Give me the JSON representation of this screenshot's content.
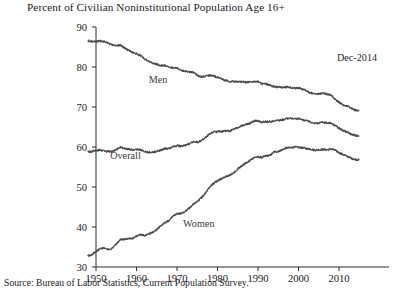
{
  "chart_data": {
    "type": "line",
    "title": "Percent of Civilian Noninstitutional Population Age 16+",
    "source": "Source: Bureau of Labor Statistics, Current Population Survey.",
    "xlabel": "",
    "ylabel": "",
    "xlim": [
      1948,
      2015.5
    ],
    "ylim": [
      30,
      90
    ],
    "grid": false,
    "legend_position": "inline-annotations",
    "xticks": [
      1950,
      1960,
      1970,
      1980,
      1990,
      2000,
      2010
    ],
    "xticklabels": [
      "1950",
      "1960",
      "1970",
      "1980",
      "1990",
      "2000",
      "2010"
    ],
    "yticks": [
      30,
      40,
      50,
      60,
      70,
      80,
      90
    ],
    "yticklabels": [
      "30",
      "40",
      "50",
      "60",
      "70",
      "80",
      "90"
    ],
    "annotations": [
      {
        "text": "Dec-2014",
        "x": 2009.5,
        "y": 81.5,
        "name": "last-observation-label"
      },
      {
        "text": "Men",
        "x": 1963.0,
        "y": 76.0,
        "name": "series-label-men"
      },
      {
        "text": "Overall",
        "x": 1953.5,
        "y": 57.0,
        "name": "series-label-overall"
      },
      {
        "text": "Women",
        "x": 1971.5,
        "y": 40.0,
        "name": "series-label-women"
      }
    ],
    "x": [
      1948,
      1949,
      1950,
      1951,
      1952,
      1953,
      1954,
      1955,
      1956,
      1957,
      1958,
      1959,
      1960,
      1961,
      1962,
      1963,
      1964,
      1965,
      1966,
      1967,
      1968,
      1969,
      1970,
      1971,
      1972,
      1973,
      1974,
      1975,
      1976,
      1977,
      1978,
      1979,
      1980,
      1981,
      1982,
      1983,
      1984,
      1985,
      1986,
      1987,
      1988,
      1989,
      1990,
      1991,
      1992,
      1993,
      1994,
      1995,
      1996,
      1997,
      1998,
      1999,
      2000,
      2001,
      2002,
      2003,
      2004,
      2005,
      2006,
      2007,
      2008,
      2009,
      2010,
      2011,
      2012,
      2013,
      2014,
      2014.92
    ],
    "series": [
      {
        "name": "Men",
        "values": [
          86.6,
          86.4,
          86.4,
          86.5,
          86.3,
          86.0,
          85.5,
          85.4,
          85.5,
          84.8,
          84.2,
          83.7,
          83.3,
          82.9,
          82.0,
          81.4,
          81.0,
          80.7,
          80.4,
          80.4,
          80.1,
          79.8,
          79.7,
          79.1,
          78.9,
          78.8,
          78.7,
          77.9,
          77.5,
          77.7,
          77.9,
          77.8,
          77.4,
          77.0,
          76.6,
          76.4,
          76.4,
          76.3,
          76.3,
          76.2,
          76.2,
          76.4,
          76.4,
          75.8,
          75.8,
          75.4,
          75.1,
          75.0,
          74.9,
          75.0,
          74.9,
          74.7,
          74.8,
          74.4,
          74.1,
          73.5,
          73.3,
          73.3,
          73.5,
          73.2,
          73.0,
          72.0,
          71.2,
          70.5,
          70.2,
          69.7,
          69.2,
          69.2
        ]
      },
      {
        "name": "Overall",
        "values": [
          58.8,
          58.9,
          59.2,
          59.2,
          59.0,
          58.9,
          58.8,
          59.3,
          60.0,
          59.6,
          59.5,
          59.3,
          59.4,
          59.3,
          58.8,
          58.7,
          58.7,
          58.9,
          59.2,
          59.6,
          59.6,
          60.1,
          60.4,
          60.2,
          60.4,
          60.8,
          61.3,
          61.2,
          61.6,
          62.3,
          63.2,
          63.7,
          63.8,
          63.9,
          64.0,
          64.0,
          64.4,
          64.8,
          65.3,
          65.6,
          65.9,
          66.5,
          66.5,
          66.2,
          66.4,
          66.3,
          66.6,
          66.6,
          66.8,
          67.1,
          67.1,
          67.1,
          67.1,
          66.8,
          66.6,
          66.2,
          66.0,
          66.0,
          66.2,
          66.0,
          66.0,
          65.4,
          64.7,
          64.1,
          63.7,
          63.2,
          62.9,
          62.7
        ]
      },
      {
        "name": "Women",
        "values": [
          32.7,
          33.1,
          33.9,
          34.6,
          34.7,
          34.4,
          34.6,
          35.7,
          36.9,
          36.9,
          37.1,
          37.1,
          37.7,
          38.1,
          37.9,
          38.3,
          38.7,
          39.3,
          40.3,
          41.1,
          41.6,
          42.7,
          43.3,
          43.4,
          43.9,
          44.7,
          45.7,
          46.3,
          47.3,
          48.4,
          50.0,
          50.9,
          51.5,
          52.1,
          52.6,
          52.9,
          53.6,
          54.5,
          55.3,
          56.0,
          56.6,
          57.4,
          57.5,
          57.4,
          57.8,
          57.9,
          58.8,
          58.9,
          59.3,
          59.8,
          59.8,
          60.0,
          59.9,
          59.8,
          59.6,
          59.5,
          59.2,
          59.3,
          59.4,
          59.3,
          59.5,
          59.2,
          58.6,
          58.1,
          57.7,
          57.2,
          56.9,
          56.8
        ]
      }
    ]
  },
  "colors": {
    "line": "#4a4a4a",
    "axis": "#2a2a2a",
    "text": "#1a1a1a"
  }
}
